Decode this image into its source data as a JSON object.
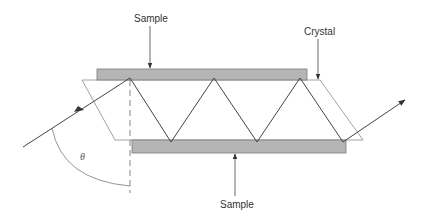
{
  "diagram": {
    "type": "ATR multiple internal reflection schematic",
    "labels": {
      "sample_top": "Sample",
      "sample_bottom": "Sample",
      "crystal": "Crystal",
      "angle": "θ"
    },
    "colors": {
      "sample_fill": "#b3b3b3",
      "sample_stroke": "#7a7a7a",
      "ray": "#444444",
      "crystal_outline": "#888888",
      "text": "#333333"
    },
    "elements": [
      "top sample plate",
      "bottom sample plate",
      "crystal parallelogram",
      "incident beam arrow",
      "zig-zag internal reflections",
      "exit beam arrow",
      "dashed normal line",
      "angle arc theta"
    ]
  }
}
